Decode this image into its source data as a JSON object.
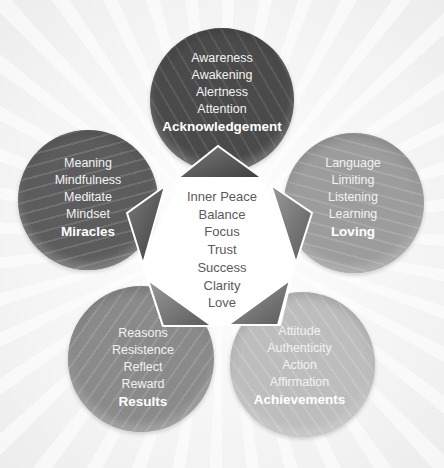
{
  "diagram": {
    "center": {
      "items": [
        "Inner Peace",
        "Balance",
        "Focus",
        "Trust",
        "Success",
        "Clarity",
        "Love"
      ]
    },
    "petals": [
      {
        "id": "top",
        "title": "Acknowledgement",
        "items": [
          "Awareness",
          "Awakening",
          "Alertness",
          "Attention"
        ],
        "color": "#4a4a4a"
      },
      {
        "id": "left",
        "title": "Miracles",
        "items": [
          "Meaning",
          "Mindfulness",
          "Meditate",
          "Mindset"
        ],
        "color": "#5c5c5c"
      },
      {
        "id": "right",
        "title": "Loving",
        "items": [
          "Language",
          "Limiting",
          "Listening",
          "Learning"
        ],
        "color": "#9c9c9c"
      },
      {
        "id": "bottom-left",
        "title": "Results",
        "items": [
          "Reasons",
          "Resistence",
          "Reflect",
          "Reward"
        ],
        "color": "#8a8a8a"
      },
      {
        "id": "bottom-right",
        "title": "Achievements",
        "items": [
          "Attitude",
          "Authenticity",
          "Action",
          "Affirmation"
        ],
        "color": "#bdbdbd"
      }
    ],
    "pointer_color": "#5e5e5e"
  }
}
